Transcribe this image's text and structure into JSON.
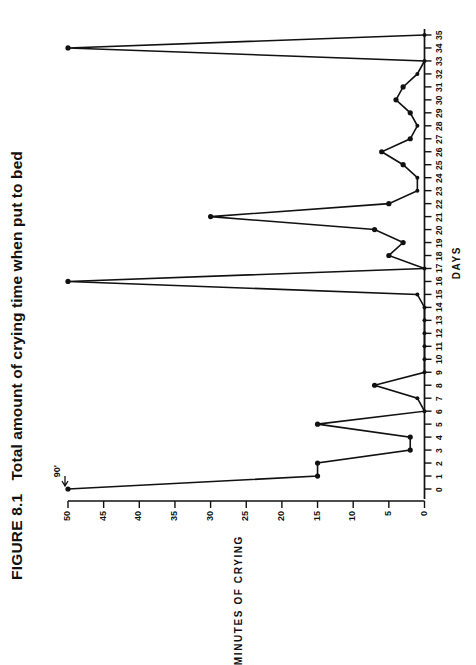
{
  "figure": {
    "label": "FIGURE 8.1",
    "title": "Total amount of crying time when put to bed"
  },
  "annotation": {
    "offscale_label": "90'",
    "offscale_day": 0,
    "offscale_true_value": 90
  },
  "chart_data": {
    "type": "line",
    "title": "Total amount of crying time when put to bed",
    "xlabel": "DAYS",
    "ylabel": "MINUTES OF CRYING",
    "xlim": [
      0,
      35
    ],
    "ylim": [
      0,
      50
    ],
    "grid": false,
    "legend": "none",
    "orientation": "rotated-90-ccw",
    "xticks": [
      0,
      1,
      2,
      3,
      4,
      5,
      6,
      7,
      8,
      9,
      10,
      11,
      12,
      13,
      14,
      15,
      16,
      17,
      18,
      19,
      20,
      21,
      22,
      23,
      24,
      25,
      26,
      27,
      28,
      29,
      30,
      31,
      32,
      33,
      34,
      35
    ],
    "xticklabels": [
      "0",
      "1",
      "2",
      "3",
      "4",
      "5",
      "6",
      "7",
      "8",
      "9",
      "10",
      "11",
      "12",
      "13",
      "14",
      "15",
      "16",
      "17",
      "18",
      "19",
      "20",
      "21",
      "22",
      "23",
      "24",
      "25",
      "26",
      "27",
      "28",
      "29",
      "30",
      "31",
      "32",
      "33",
      "34",
      "35"
    ],
    "yticks": [
      0,
      5,
      10,
      15,
      20,
      25,
      30,
      35,
      40,
      45,
      50
    ],
    "yticklabels": [
      "0",
      "5",
      "10",
      "15",
      "20",
      "25",
      "30",
      "35",
      "40",
      "45",
      "50"
    ],
    "x": [
      0,
      1,
      2,
      3,
      4,
      5,
      6,
      7,
      8,
      9,
      10,
      11,
      12,
      13,
      14,
      15,
      16,
      17,
      18,
      19,
      20,
      21,
      22,
      23,
      24,
      25,
      26,
      27,
      28,
      29,
      30,
      31,
      32,
      33,
      34,
      35
    ],
    "values": [
      50,
      15,
      15,
      2,
      2,
      15,
      0,
      1,
      7,
      0,
      0,
      0,
      0,
      0,
      0,
      1,
      50,
      0,
      5,
      3,
      7,
      30,
      5,
      1,
      1,
      3,
      6,
      2,
      1,
      2,
      4,
      3,
      1,
      0,
      50,
      0
    ],
    "annotations": [
      {
        "x": 0,
        "text": "90'",
        "note": "point plotted at axis ceiling; true value 90 minutes"
      }
    ]
  }
}
